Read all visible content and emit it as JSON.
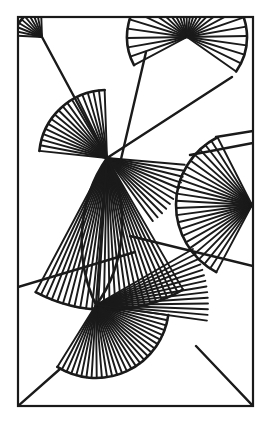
{
  "canvas": {
    "width": 271,
    "height": 424,
    "background": "#ffffff",
    "title": "Abstract Radial Fan Line Composition"
  },
  "style": {
    "stroke": "#1a1a1a",
    "frame_stroke_width": 2.2,
    "ray_stroke_width": 1.9,
    "arc_stroke_width": 2.6,
    "edge_stroke_width": 2.4,
    "fill": "none",
    "linecap": "butt"
  },
  "frame": {
    "label": "outer-rectangle",
    "x": 18,
    "y": 17,
    "width": 235,
    "height": 389
  },
  "hubs": [
    {
      "id": "hub-top-left",
      "label": "top-left-fan-center",
      "x": 42,
      "y": 37
    },
    {
      "id": "hub-top-right",
      "label": "top-right-fan-center",
      "x": 187,
      "y": 37
    },
    {
      "id": "hub-center",
      "label": "central-fan-center",
      "x": 107,
      "y": 158
    },
    {
      "id": "hub-right",
      "label": "right-edge-fan-center",
      "x": 252,
      "y": 205
    },
    {
      "id": "hub-lower",
      "label": "lower-fan-center",
      "x": 96,
      "y": 305
    }
  ],
  "fans": [
    {
      "id": "fan-top-left",
      "name": "top-left-corner-fan",
      "cx": 42,
      "cy": 37,
      "r_inner": 0,
      "r_outer": 27,
      "a_start": 183,
      "a_end": 268,
      "rays": 9,
      "arc": true,
      "arc_r": 27
    },
    {
      "id": "fan-top-right",
      "name": "top-right-sunburst-fan",
      "cx": 187,
      "cy": 37,
      "r_inner": 0,
      "r_outer": 60,
      "a_start": 152,
      "a_end": 395,
      "rays": 27,
      "arc": true,
      "arc_r": 60
    },
    {
      "id": "fan-center-upper",
      "name": "central-upper-left-fan",
      "cx": 107,
      "cy": 158,
      "r_inner": 0,
      "r_outer": 68,
      "a_start": 186,
      "a_end": 268,
      "rays": 17,
      "arc": true,
      "arc_r": 68
    },
    {
      "id": "fan-center-lower",
      "name": "central-lower-leaf-fan",
      "cx": 107,
      "cy": 158,
      "r_inner": 0,
      "r_outer": 152,
      "a_start": 60,
      "a_end": 118,
      "rays": 26,
      "arc": true,
      "arc_r": 152
    },
    {
      "id": "fan-center-right",
      "name": "central-right-narrow-fan",
      "cx": 107,
      "cy": 158,
      "r_inner": 0,
      "r_outer": 78,
      "a_start": 5,
      "a_end": 54,
      "rays": 11,
      "arc": false,
      "arc_r": 78
    },
    {
      "id": "fan-right-edge",
      "name": "right-edge-sunburst-fan",
      "cx": 252,
      "cy": 205,
      "r_inner": 0,
      "r_outer": 76,
      "a_start": 118,
      "a_end": 243,
      "rays": 23,
      "arc": true,
      "arc_r": 76
    },
    {
      "id": "fan-lower-main",
      "name": "lower-wide-sunburst-fan",
      "cx": 96,
      "cy": 305,
      "r_inner": 0,
      "r_outer": 73,
      "a_start": 8,
      "a_end": 122,
      "rays": 28,
      "arc": true,
      "arc_r": 73
    },
    {
      "id": "fan-lower-upper",
      "name": "lower-upper-narrow-fan",
      "cx": 96,
      "cy": 305,
      "r_inner": 0,
      "r_outer": 112,
      "a_start": 330,
      "a_end": 8,
      "rays": 13,
      "arc": false,
      "arc_r": 112
    }
  ],
  "segments": [
    {
      "id": "seg-tl-to-center",
      "name": "top-left-to-center-line",
      "x1": 42,
      "y1": 37,
      "x2": 107,
      "y2": 158
    },
    {
      "id": "seg-tr-to-center",
      "name": "top-right-to-center-line",
      "x1": 146,
      "y1": 52,
      "x2": 118,
      "y2": 172
    },
    {
      "id": "seg-center-to-tr",
      "name": "center-to-top-right-line",
      "x1": 107,
      "y1": 158,
      "x2": 232,
      "y2": 77
    },
    {
      "id": "seg-center-right",
      "name": "center-to-right-border",
      "x1": 130,
      "y1": 236,
      "x2": 253,
      "y2": 266
    },
    {
      "id": "seg-left-diag",
      "name": "left-border-diagonal",
      "x1": 18,
      "y1": 287,
      "x2": 135,
      "y2": 252
    },
    {
      "id": "seg-upper-right",
      "name": "upper-right-field-line",
      "x1": 190,
      "y1": 155,
      "x2": 253,
      "y2": 143
    },
    {
      "id": "seg-right-vert",
      "name": "right-fan-upper-edge",
      "x1": 216,
      "y1": 137,
      "x2": 253,
      "y2": 131
    },
    {
      "id": "seg-bl-corner",
      "name": "bottom-left-corner-line",
      "x1": 18,
      "y1": 406,
      "x2": 60,
      "y2": 369
    },
    {
      "id": "seg-br-corner",
      "name": "bottom-right-corner-line",
      "x1": 196,
      "y1": 346,
      "x2": 253,
      "y2": 406
    },
    {
      "id": "seg-lower-leaf",
      "name": "lower-leaf-right-edge",
      "x1": 107,
      "y1": 158,
      "x2": 96,
      "y2": 305
    }
  ],
  "arcs": [
    {
      "id": "arc-center-leaf-left",
      "name": "central-leaf-left-arc",
      "x1": 107,
      "y1": 158,
      "x2": 96,
      "y2": 305,
      "rx": 110,
      "ry": 130,
      "sweep": 0,
      "large": 0
    },
    {
      "id": "arc-center-leaf-right",
      "name": "central-leaf-right-arc",
      "x1": 107,
      "y1": 158,
      "x2": 96,
      "y2": 305,
      "rx": 96,
      "ry": 120,
      "sweep": 1,
      "large": 0
    }
  ],
  "meta": {
    "palette": [
      "#1a1a1a",
      "#ffffff"
    ]
  }
}
